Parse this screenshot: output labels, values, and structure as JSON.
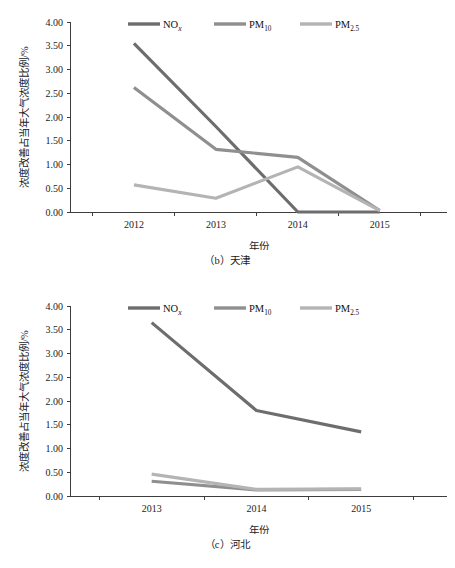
{
  "figure_b": {
    "caption": "（b）天津",
    "axis": {
      "xlabel": "年份",
      "ylabel": "浓度改善占当年大气浓度比例/%"
    },
    "legend": [
      {
        "name": "NOx",
        "base": "NO",
        "sub": "x",
        "color": "#6d6d6d"
      },
      {
        "name": "PM10",
        "base": "PM",
        "sub": "10",
        "color": "#8f8f8f"
      },
      {
        "name": "PM2.5",
        "base": "PM",
        "sub": "2.5",
        "color": "#b4b4b4"
      }
    ],
    "yticks": [
      "0.00",
      "0.50",
      "1.00",
      "1.50",
      "2.00",
      "2.50",
      "3.00",
      "3.50",
      "4.00"
    ],
    "xticks": [
      "2012",
      "2013",
      "2014",
      "2015"
    ]
  },
  "figure_c": {
    "caption": "（c）河北",
    "axis": {
      "xlabel": "年份",
      "ylabel": "浓度改善占当年大气浓度比例/%"
    },
    "legend": [
      {
        "name": "NOx",
        "base": "NO",
        "sub": "x",
        "color": "#6d6d6d"
      },
      {
        "name": "PM10",
        "base": "PM",
        "sub": "10",
        "color": "#8f8f8f"
      },
      {
        "name": "PM2.5",
        "base": "PM",
        "sub": "2.5",
        "color": "#b4b4b4"
      }
    ],
    "yticks": [
      "0.00",
      "0.50",
      "1.00",
      "1.50",
      "2.00",
      "2.50",
      "3.00",
      "3.50",
      "4.00"
    ],
    "xticks": [
      "2013",
      "2014",
      "2015"
    ]
  },
  "chart_data": [
    {
      "type": "line",
      "title": "（b）天津",
      "xlabel": "年份",
      "ylabel": "浓度改善占当年大气浓度比例/%",
      "categories": [
        "2012",
        "2013",
        "2014",
        "2015"
      ],
      "ylim": [
        0,
        4
      ],
      "ytick_step": 0.5,
      "grid": false,
      "legend_position": "top-center",
      "series": [
        {
          "name": "NOx",
          "color": "#6d6d6d",
          "values": [
            3.55,
            1.8,
            0.0,
            0.0
          ]
        },
        {
          "name": "PM10",
          "color": "#8f8f8f",
          "values": [
            2.62,
            1.32,
            1.15,
            0.03
          ]
        },
        {
          "name": "PM2.5",
          "color": "#b4b4b4",
          "values": [
            0.57,
            0.29,
            0.95,
            0.03
          ]
        }
      ]
    },
    {
      "type": "line",
      "title": "（c）河北",
      "xlabel": "年份",
      "ylabel": "浓度改善占当年大气浓度比例/%",
      "categories": [
        "2013",
        "2014",
        "2015"
      ],
      "ylim": [
        0,
        4
      ],
      "ytick_step": 0.5,
      "grid": false,
      "legend_position": "top-center",
      "series": [
        {
          "name": "NOx",
          "color": "#6d6d6d",
          "values": [
            3.65,
            1.8,
            1.35
          ]
        },
        {
          "name": "PM10",
          "color": "#8f8f8f",
          "values": [
            0.31,
            0.13,
            0.14
          ]
        },
        {
          "name": "PM2.5",
          "color": "#b4b4b4",
          "values": [
            0.46,
            0.14,
            0.15
          ]
        }
      ]
    }
  ]
}
